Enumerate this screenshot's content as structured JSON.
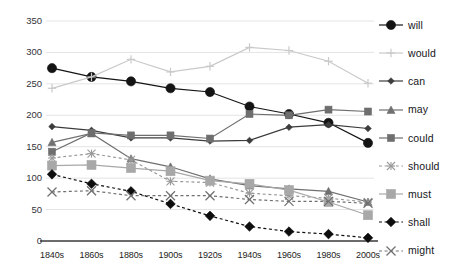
{
  "chart_data": {
    "type": "line",
    "title": "",
    "subtitle": "",
    "xlabel": "",
    "ylabel": "",
    "categories": [
      "1840s",
      "1860s",
      "1880s",
      "1900s",
      "1920s",
      "1940s",
      "1960s",
      "1980s",
      "2000s"
    ],
    "ylim": [
      0,
      350
    ],
    "yticks": [
      0,
      50,
      100,
      150,
      200,
      250,
      300,
      350
    ],
    "ytick_labels": [
      "0",
      "50",
      "100",
      "150",
      "200",
      "250",
      "300",
      "350"
    ],
    "grid": true,
    "legend_position": "right",
    "series": [
      {
        "name": "will",
        "color": "#141414",
        "marker": "circle",
        "marker_size": 8,
        "dash": "solid",
        "values": [
          275,
          261,
          254,
          243,
          237,
          214,
          202,
          188,
          156
        ]
      },
      {
        "name": "would",
        "color": "#c9c9c9",
        "marker": "plus",
        "marker_size": 6,
        "dash": "solid",
        "values": [
          243,
          261,
          289,
          269,
          278,
          308,
          303,
          286,
          251
        ]
      },
      {
        "name": "can",
        "color": "#3c3c3c",
        "marker": "diamond",
        "marker_size": 5,
        "dash": "solid",
        "values": [
          182,
          176,
          164,
          164,
          159,
          160,
          181,
          185,
          179
        ]
      },
      {
        "name": "may",
        "color": "#707070",
        "marker": "triangle",
        "marker_size": 6,
        "dash": "solid",
        "values": [
          157,
          171,
          131,
          118,
          99,
          88,
          83,
          79,
          62
        ]
      },
      {
        "name": "could",
        "color": "#6e6e6e",
        "marker": "square",
        "marker_size": 7,
        "dash": "solid",
        "values": [
          142,
          172,
          168,
          168,
          163,
          202,
          200,
          209,
          206
        ]
      },
      {
        "name": "should",
        "color": "#9a9a9a",
        "marker": "asterisk",
        "marker_size": 7,
        "dash": "dashed",
        "values": [
          132,
          139,
          129,
          95,
          93,
          76,
          72,
          68,
          62
        ]
      },
      {
        "name": "must",
        "color": "#a8a8a8",
        "marker": "square",
        "marker_size": 9,
        "dash": "solid",
        "values": [
          120,
          121,
          116,
          111,
          96,
          91,
          81,
          62,
          41
        ]
      },
      {
        "name": "shall",
        "color": "#0d0d0d",
        "marker": "bigdiamond",
        "marker_size": 8,
        "dash": "dashed",
        "values": [
          106,
          91,
          79,
          59,
          40,
          23,
          15,
          11,
          5
        ]
      },
      {
        "name": "might",
        "color": "#707070",
        "marker": "cross",
        "marker_size": 8,
        "dash": "dashed",
        "values": [
          78,
          80,
          72,
          72,
          72,
          66,
          63,
          63,
          60
        ]
      }
    ]
  },
  "legend": {
    "items": [
      {
        "label": "will"
      },
      {
        "label": "would"
      },
      {
        "label": "can"
      },
      {
        "label": "may"
      },
      {
        "label": "could"
      },
      {
        "label": "should"
      },
      {
        "label": "must"
      },
      {
        "label": "shall"
      },
      {
        "label": "might"
      }
    ]
  }
}
